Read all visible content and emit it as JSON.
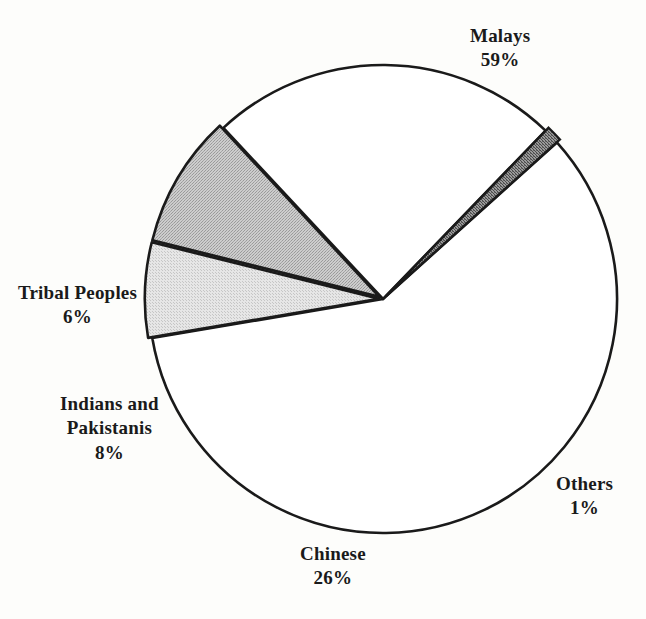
{
  "chart_data": {
    "type": "pie",
    "title": "",
    "subtitle": "",
    "xlabel": "",
    "ylabel": "",
    "legend_position": "none",
    "grid": false,
    "units": "percent",
    "total": 100,
    "categories": [
      "Malays",
      "Chinese",
      "Indians and Pakistanis",
      "Tribal Peoples",
      "Others"
    ],
    "values": [
      59,
      26,
      8,
      6,
      1
    ],
    "slices": [
      {
        "id": "malays",
        "label": "Malays",
        "value": 59,
        "value_label": "59%",
        "fill": "#ffffff",
        "stroke": "#1a1a1a",
        "exploded": false,
        "start_angle": -42,
        "end_angle": 170.4
      },
      {
        "id": "chinese",
        "label": "Chinese",
        "value": 26,
        "value_label": "26%",
        "fill": "#ffffff",
        "stroke": "#1a1a1a",
        "exploded": false,
        "start_angle": 227,
        "end_angle": 314
      },
      {
        "id": "indians-and-pakistanis",
        "label_line1": "Indians and",
        "label_line2": "Pakistanis",
        "label": "Indians and Pakistanis",
        "value": 8,
        "value_label": "8%",
        "fill": "#b9b9b9",
        "stroke": "#1a1a1a",
        "exploded": true,
        "start_angle": 194,
        "end_angle": 227
      },
      {
        "id": "tribal-peoples",
        "label": "Tribal Peoples",
        "value": 6,
        "value_label": "6%",
        "fill": "#dcdcdc",
        "stroke": "#1a1a1a",
        "exploded": true,
        "start_angle": 170.4,
        "end_angle": 194
      },
      {
        "id": "others",
        "label": "Others",
        "value": 1,
        "value_label": "1%",
        "fill": "#6e6e6e",
        "stroke": "#1a1a1a",
        "exploded": true,
        "start_angle": 314,
        "end_angle": 318
      }
    ],
    "geometry": {
      "center_x": 383,
      "center_y": 299,
      "radius": 234
    },
    "colors": {
      "background": "#fdfdfb",
      "outline": "#1a1a1a",
      "text": "#1a1a1a",
      "fill_light_gray": "#dcdcdc",
      "fill_mid_gray": "#b9b9b9",
      "fill_dark_gray": "#6e6e6e",
      "fill_white": "#ffffff"
    }
  }
}
